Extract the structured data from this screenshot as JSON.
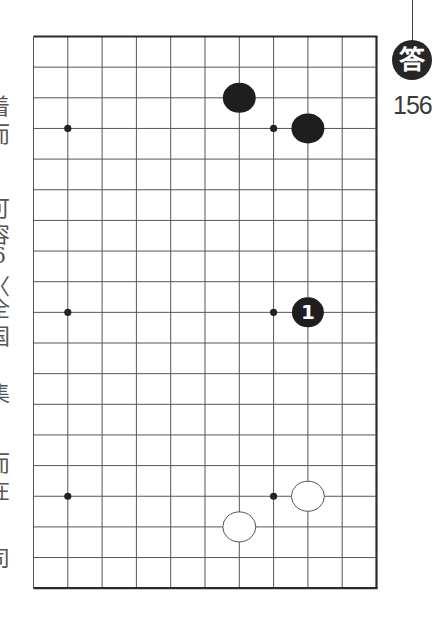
{
  "header": {
    "badge_label": "答",
    "problem_number": "156"
  },
  "side_text": {
    "glyphs": [
      {
        "char": "着",
        "y": 88
      },
      {
        "char": "而",
        "y": 116
      },
      {
        "char": "可",
        "y": 190
      },
      {
        "char": "容",
        "y": 216
      },
      {
        "char": "6",
        "y": 243
      },
      {
        "char": "〈",
        "y": 268
      },
      {
        "char": "全",
        "y": 290
      },
      {
        "char": "国",
        "y": 318
      },
      {
        "char": "〉",
        "y": 345
      },
      {
        "char": "集",
        "y": 375
      },
      {
        "char": "而",
        "y": 445
      },
      {
        "char": "在",
        "y": 472
      },
      {
        "char": "司",
        "y": 540
      }
    ]
  },
  "board": {
    "columns": 11,
    "rows": 19,
    "origin_x": 33.5,
    "origin_y": 36.5,
    "spacing_x": 34.3,
    "spacing_y": 30.65,
    "line_color": "#555555",
    "edge_color": "#2a2a2a",
    "thick_edges": [
      "top",
      "right",
      "bottom"
    ],
    "star_points": [
      {
        "col": 1,
        "row": 3
      },
      {
        "col": 7,
        "row": 3
      },
      {
        "col": 1,
        "row": 9
      },
      {
        "col": 7,
        "row": 9
      },
      {
        "col": 1,
        "row": 15
      },
      {
        "col": 7,
        "row": 15
      }
    ],
    "stones": [
      {
        "color": "black",
        "col": 6,
        "row": 2,
        "label": ""
      },
      {
        "color": "black",
        "col": 8,
        "row": 3,
        "label": ""
      },
      {
        "color": "black",
        "col": 8,
        "row": 9,
        "label": "1"
      },
      {
        "color": "white",
        "col": 8,
        "row": 15,
        "label": ""
      },
      {
        "color": "white",
        "col": 6,
        "row": 16,
        "label": ""
      }
    ],
    "stone_colors": {
      "black": "#1e1e1e",
      "white": "#ffffff",
      "white_outline": "#555555",
      "label_on_black": "#ffffff"
    }
  }
}
